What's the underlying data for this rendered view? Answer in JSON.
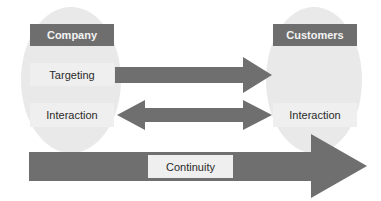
{
  "diagram": {
    "left_entity": {
      "title": "Company",
      "items": [
        "Targeting",
        "Interaction"
      ]
    },
    "right_entity": {
      "title": "Customers",
      "items": [
        "Interaction"
      ]
    },
    "arrows": [
      {
        "from": "Targeting",
        "to": "Customers",
        "type": "one-way"
      },
      {
        "from": "Interaction",
        "to": "Interaction",
        "type": "two-way"
      },
      {
        "label": "Continuity",
        "type": "one-way",
        "direction": "right"
      }
    ],
    "continuity_label": "Continuity"
  },
  "colors": {
    "ellipse": "#e9e9e9",
    "header": "#6e6e6e",
    "arrow": "#6f6f6f",
    "label_box": "#efefef"
  }
}
